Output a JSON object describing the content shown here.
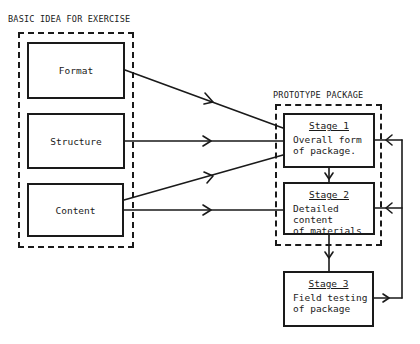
{
  "left_group": {
    "title": "BASIC IDEA FOR EXERCISE",
    "items": [
      {
        "label": "Format"
      },
      {
        "label": "Structure"
      },
      {
        "label": "Content"
      }
    ]
  },
  "right_group": {
    "title": "PROTOTYPE PACKAGE",
    "stages": [
      {
        "title": "Stage 1",
        "description": "Overall form\nof package."
      },
      {
        "title": "Stage 2",
        "description": "Detailed content\nof materials"
      }
    ]
  },
  "outside_stage": {
    "title": "Stage 3",
    "description": "Field testing\nof package"
  },
  "connections": [
    {
      "from": "Format",
      "to": "Stage 1"
    },
    {
      "from": "Structure",
      "to": "Stage 1"
    },
    {
      "from": "Content",
      "to": "Stage 1"
    },
    {
      "from": "Content",
      "to": "Stage 2"
    },
    {
      "from": "Stage 1",
      "to": "Stage 2"
    },
    {
      "from": "Stage 2",
      "to": "Stage 3"
    },
    {
      "from": "Stage 3",
      "to": "Stage 1",
      "type": "feedback"
    },
    {
      "from": "Stage 3",
      "to": "Stage 2",
      "type": "feedback"
    }
  ]
}
